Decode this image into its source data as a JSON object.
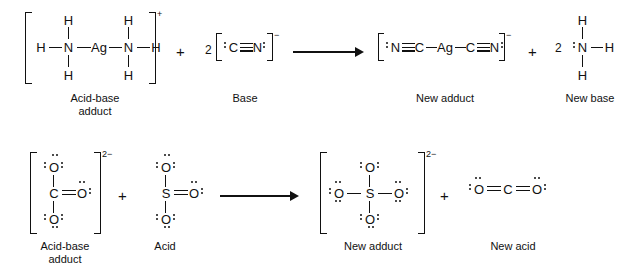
{
  "figure": {
    "type": "lewis-structure-reaction-diagram",
    "reactions": [
      {
        "id": "reaction-1",
        "equation": "[H3N-Ag-NH3]+ + 2 [:C:::N:]- -> [:N:::C-Ag-C:::N:]- + 2 :NH3",
        "reactants": [
          {
            "name": "diamminesilver-cation",
            "label": "Acid-base adduct",
            "label_line1": "Acid-base",
            "label_line2": "adduct",
            "charge": "+",
            "coefficient": "",
            "bracketed": true,
            "atoms": {
              "center": "Ag",
              "left_n": "N",
              "right_n": "N",
              "h": "H"
            }
          },
          {
            "name": "cyanide-ion",
            "label": "Base",
            "label_line1": "Base",
            "label_line2": "",
            "charge": "−",
            "coefficient": "2",
            "bracketed": true,
            "atoms": {
              "left": "C",
              "right": "N"
            },
            "bond": "triple"
          }
        ],
        "products": [
          {
            "name": "dicyanoargentate-ion",
            "label": "New adduct",
            "label_line1": "New adduct",
            "label_line2": "",
            "charge": "−",
            "coefficient": "",
            "bracketed": true,
            "atoms": {
              "center": "Ag",
              "n": "N",
              "c": "C"
            }
          },
          {
            "name": "ammonia",
            "label": "New base",
            "label_line1": "New base",
            "label_line2": "",
            "charge": "",
            "coefficient": "2",
            "bracketed": false,
            "atoms": {
              "center": "N",
              "h": "H"
            }
          }
        ]
      },
      {
        "id": "reaction-2",
        "equation": "[CO3]2- + SO3 -> [SO4]2- + O=C=O",
        "reactants": [
          {
            "name": "carbonate-ion",
            "label": "Acid-base adduct",
            "label_line1": "Acid-base",
            "label_line2": "adduct",
            "charge": "2−",
            "coefficient": "",
            "bracketed": true,
            "atoms": {
              "center": "C",
              "o": "O"
            }
          },
          {
            "name": "sulfur-trioxide",
            "label": "Acid",
            "label_line1": "Acid",
            "label_line2": "",
            "charge": "",
            "coefficient": "",
            "bracketed": false,
            "atoms": {
              "center": "S",
              "o": "O"
            }
          }
        ],
        "products": [
          {
            "name": "sulfate-ion",
            "label": "New adduct",
            "label_line1": "New adduct",
            "label_line2": "",
            "charge": "2−",
            "coefficient": "",
            "bracketed": true,
            "atoms": {
              "center": "S",
              "o": "O"
            }
          },
          {
            "name": "carbon-dioxide",
            "label": "New acid",
            "label_line1": "New acid",
            "label_line2": "",
            "charge": "",
            "coefficient": "",
            "bracketed": false,
            "atoms": {
              "center": "C",
              "o": "O"
            }
          }
        ]
      }
    ]
  },
  "symbols": {
    "plus": "+",
    "minus": "−",
    "charge_plus": "+",
    "charge_minus": "−",
    "charge_2minus": "2−",
    "coeff_two": "2"
  },
  "atoms": {
    "Ag": "Ag",
    "N": "N",
    "H": "H",
    "C": "C",
    "O": "O",
    "S": "S"
  },
  "labels": {
    "acid_base_adduct_l1": "Acid-base",
    "acid_base_adduct_l2": "adduct",
    "base": "Base",
    "acid": "Acid",
    "new_adduct": "New adduct",
    "new_base": "New base",
    "new_acid": "New acid"
  },
  "colors": {
    "ink": "#111111",
    "background": "#ffffff"
  }
}
